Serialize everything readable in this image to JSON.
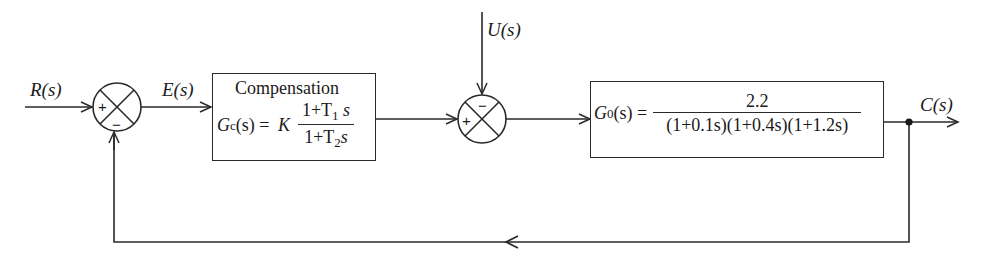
{
  "signals": {
    "input": "R(s)",
    "error": "E(s)",
    "disturbance": "U(s)",
    "output": "C(s)"
  },
  "compensator": {
    "title": "Compensation",
    "lhs": "G",
    "lhs_sub": "c",
    "lhs_arg": "(s) = ",
    "gain": "K",
    "numerator": "1+T",
    "numerator_sub": "1",
    "numerator_tail": " s",
    "denominator": "1+T",
    "denominator_sub": "2",
    "denominator_tail": "s"
  },
  "plant": {
    "lhs": "G",
    "lhs_sub": "0",
    "lhs_arg": "(s) =",
    "numerator": "2.2",
    "denominator": "(1+0.1s)(1+0.4s)(1+1.2s)"
  },
  "summing_junction_1": {
    "plus": "+",
    "minus": "−"
  },
  "summing_junction_2": {
    "plus": "+",
    "minus": "−"
  },
  "colors": {
    "line": "#2a2a2a",
    "background": "#ffffff"
  }
}
